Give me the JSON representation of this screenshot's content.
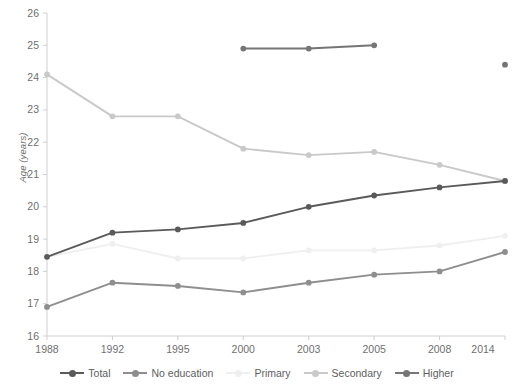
{
  "chart_data": {
    "type": "line",
    "title": "",
    "xlabel": "",
    "ylabel": "Age (years)",
    "categories": [
      "1988",
      "1992",
      "1995",
      "2000",
      "2003",
      "2005",
      "2008",
      "2014"
    ],
    "ylim": [
      16,
      26
    ],
    "yticks": [
      16,
      17,
      18,
      19,
      20,
      21,
      22,
      23,
      24,
      25,
      26
    ],
    "grid": false,
    "legend_position": "bottom",
    "series": [
      {
        "name": "Total",
        "color": "#5a5a5a",
        "values": [
          18.45,
          19.2,
          19.3,
          19.5,
          20.0,
          20.35,
          20.6,
          20.8
        ]
      },
      {
        "name": "No education",
        "color": "#8e8e8e",
        "values": [
          16.9,
          17.65,
          17.55,
          17.35,
          17.65,
          17.9,
          18.0,
          18.6
        ]
      },
      {
        "name": "Primary",
        "color": "#efefef",
        "values": [
          18.45,
          18.85,
          18.4,
          18.4,
          18.65,
          18.65,
          18.8,
          19.1
        ]
      },
      {
        "name": "Secondary",
        "color": "#c9c9c9",
        "values": [
          24.1,
          22.8,
          22.8,
          21.8,
          21.6,
          21.7,
          21.3,
          20.8
        ]
      },
      {
        "name": "Higher",
        "color": "#757575",
        "values": [
          null,
          null,
          null,
          24.9,
          24.9,
          25.0,
          null,
          24.4
        ]
      }
    ]
  },
  "axis": {
    "y_title": "Age (years)",
    "y_labels": [
      "26",
      "25",
      "24",
      "23",
      "22",
      "21",
      "20",
      "19",
      "18",
      "17",
      "16"
    ],
    "x_labels": [
      "1988",
      "1992",
      "1995",
      "2000",
      "2003",
      "2005",
      "2008",
      "2014"
    ]
  },
  "legend": {
    "items": [
      {
        "label": "Total",
        "color": "#5a5a5a"
      },
      {
        "label": "No education",
        "color": "#8e8e8e"
      },
      {
        "label": "Primary",
        "color": "#efefef"
      },
      {
        "label": "Secondary",
        "color": "#c9c9c9"
      },
      {
        "label": "Higher",
        "color": "#757575"
      }
    ]
  },
  "colors": {
    "axis_line": "#cfcfcf",
    "tick_text": "#6f6f6f",
    "background": "#ffffff"
  }
}
